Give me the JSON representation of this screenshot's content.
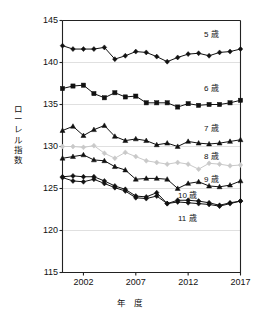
{
  "chart_data": {
    "type": "line",
    "title": "",
    "xlabel": "年 度",
    "ylabel": "ローレル指数",
    "ylim": [
      115,
      145
    ],
    "xlim": [
      2000,
      2017
    ],
    "yticks": [
      115,
      120,
      125,
      130,
      135,
      140,
      145
    ],
    "xticks": [
      2002,
      2007,
      2012,
      2017
    ],
    "grid": "horizontal",
    "legend_position": "inline-right",
    "x": [
      2000,
      2001,
      2002,
      2003,
      2004,
      2005,
      2006,
      2007,
      2008,
      2009,
      2010,
      2011,
      2012,
      2013,
      2014,
      2015,
      2016,
      2017
    ],
    "series": [
      {
        "name": "5歳",
        "label": "5 歳",
        "color": "#111111",
        "marker": "diamond",
        "values": [
          142.0,
          141.6,
          141.6,
          141.6,
          141.8,
          140.4,
          140.8,
          141.3,
          141.2,
          140.7,
          140.1,
          140.6,
          141.0,
          141.1,
          140.8,
          141.2,
          141.3,
          141.6
        ]
      },
      {
        "name": "6歳",
        "label": "6 歳",
        "color": "#111111",
        "marker": "square",
        "values": [
          136.9,
          137.2,
          137.3,
          136.3,
          135.8,
          136.4,
          135.9,
          136.0,
          135.2,
          135.2,
          135.2,
          134.7,
          135.1,
          134.9,
          135.0,
          135.0,
          135.2,
          135.5
        ]
      },
      {
        "name": "7歳",
        "label": "7 歳",
        "color": "#111111",
        "marker": "triangle",
        "values": [
          131.9,
          132.4,
          131.3,
          132.0,
          132.5,
          131.2,
          130.7,
          130.9,
          130.7,
          130.2,
          130.4,
          130.0,
          130.6,
          130.4,
          130.3,
          130.4,
          130.6,
          130.8
        ]
      },
      {
        "name": "8歳",
        "label": "8 歳",
        "color": "#c9c9c9",
        "marker": "diamond",
        "values": [
          130.0,
          130.0,
          129.9,
          130.1,
          129.2,
          128.6,
          129.3,
          128.8,
          128.3,
          128.1,
          127.9,
          128.1,
          127.9,
          127.3,
          128.0,
          127.9,
          127.7,
          127.8
        ]
      },
      {
        "name": "9歳",
        "label": "9 歳",
        "color": "#111111",
        "marker": "triangle",
        "values": [
          128.6,
          128.8,
          129.0,
          128.4,
          128.3,
          127.6,
          127.2,
          126.1,
          126.2,
          126.2,
          126.1,
          125.0,
          125.6,
          125.8,
          125.3,
          125.2,
          125.4,
          125.9
        ]
      },
      {
        "name": "10歳",
        "label": "10 歳",
        "color": "#111111",
        "marker": "diamond",
        "values": [
          126.4,
          126.5,
          126.4,
          126.4,
          125.9,
          125.3,
          124.9,
          124.1,
          124.0,
          124.5,
          123.2,
          123.6,
          123.6,
          123.5,
          123.3,
          123.0,
          123.3,
          123.5
        ]
      },
      {
        "name": "11歳",
        "label": "11 歳",
        "color": "#111111",
        "marker": "diamond",
        "values": [
          126.3,
          125.9,
          125.8,
          126.1,
          125.6,
          125.1,
          124.7,
          123.9,
          123.8,
          124.1,
          123.2,
          123.4,
          123.3,
          123.2,
          123.1,
          122.9,
          123.2,
          123.5
        ]
      }
    ],
    "series_label_positions": [
      {
        "name": "5歳",
        "x": 204,
        "y": 28
      },
      {
        "name": "6歳",
        "x": 204,
        "y": 82
      },
      {
        "name": "7歳",
        "x": 204,
        "y": 122
      },
      {
        "name": "8歳",
        "x": 204,
        "y": 150
      },
      {
        "name": "9歳",
        "x": 204,
        "y": 173
      },
      {
        "name": "10歳",
        "x": 178,
        "y": 189
      },
      {
        "name": "11歳",
        "x": 178,
        "y": 212
      }
    ]
  },
  "axis": {
    "ylabel_chars": [
      "ロ",
      "ー",
      "レ",
      "ル",
      "指",
      "数"
    ],
    "ytick_labels": [
      "145",
      "140",
      "135",
      "130",
      "125",
      "120",
      "115"
    ],
    "xtick_labels": [
      "2002",
      "2007",
      "2012",
      "2017"
    ],
    "xtitle": "年 度"
  }
}
